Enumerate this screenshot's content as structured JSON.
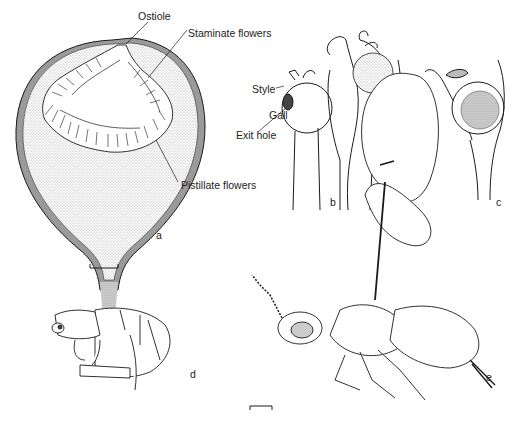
{
  "figure": {
    "panels": [
      {
        "id": "a",
        "label": "a",
        "subject": "fig syconium longitudinal section"
      },
      {
        "id": "b",
        "label": "b",
        "subject": "galled and normal pistillate flowers"
      },
      {
        "id": "c",
        "label": "c",
        "subject": "seed-bearing pistillate flower"
      },
      {
        "id": "d",
        "label": "d",
        "subject": "wingless male fig wasp"
      },
      {
        "id": "e",
        "label": "e",
        "subject": "winged female fig wasp"
      }
    ],
    "annotations": {
      "ostiole": "Ostiole",
      "staminate": "Staminate flowers",
      "pistillate": "Pistillate flowers",
      "style": "Style",
      "exit_hole": "Exit hole",
      "gall": "Gall"
    },
    "colors": {
      "line": "#1a1a1a",
      "stipple": "#cfcfcf",
      "wall": "#9a9a9a",
      "background": "#ffffff"
    }
  }
}
